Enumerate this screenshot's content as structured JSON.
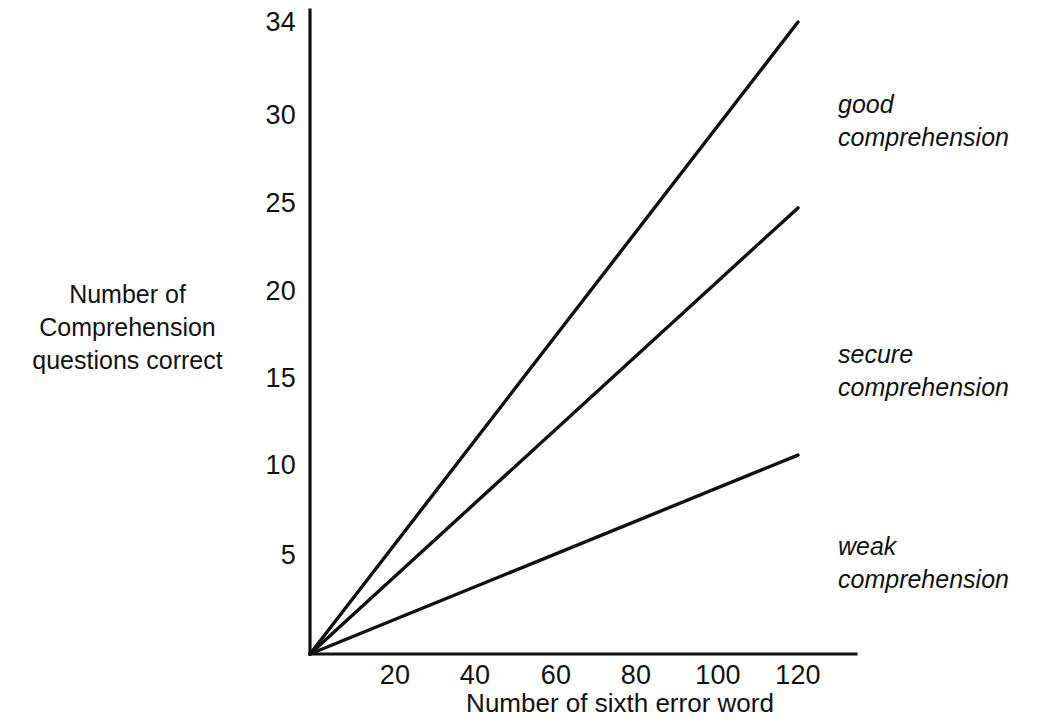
{
  "chart_data": {
    "type": "line",
    "title": "",
    "subtitle": "",
    "xlabel": "Number of sixth error word",
    "ylabel": "Number of Comprehension questions correct",
    "ylabel_lines": [
      "Number of",
      "Comprehension",
      "questions correct"
    ],
    "xlim": [
      0,
      136
    ],
    "ylim": [
      0,
      34
    ],
    "xticks": [
      20,
      40,
      60,
      80,
      100,
      120
    ],
    "xtick_labels": [
      "20",
      "40",
      "60",
      "80",
      "100",
      "120"
    ],
    "yticks": [
      5,
      10,
      15,
      20,
      25,
      30,
      34
    ],
    "ytick_labels": [
      "5",
      "10",
      "15",
      "20",
      "25",
      "30",
      "34"
    ],
    "grid": false,
    "legend_position": "right-inline-annotations",
    "line_color": "#111111",
    "axis_color": "#111111",
    "background_color": "#ffffff",
    "series": [
      {
        "name": "good comprehension",
        "x": [
          0,
          120
        ],
        "values": [
          0,
          34
        ],
        "slope": 0.2833,
        "annotation_lines": [
          "good",
          "comprehension"
        ]
      },
      {
        "name": "secure comprehension",
        "x": [
          0,
          120
        ],
        "values": [
          0,
          24
        ],
        "slope": 0.2,
        "annotation_lines": [
          "secure",
          "comprehension"
        ]
      },
      {
        "name": "weak comprehension",
        "x": [
          0,
          120
        ],
        "values": [
          0,
          10.7
        ],
        "slope": 0.0892,
        "annotation_lines": [
          "weak",
          "comprehension"
        ]
      }
    ]
  },
  "annotations": {
    "good": {
      "line1": "good",
      "line2": "comprehension"
    },
    "secure": {
      "line1": "secure",
      "line2": "comprehension"
    },
    "weak": {
      "line1": "weak",
      "line2": "comprehension"
    }
  },
  "axis_labels": {
    "y_line1": "Number of",
    "y_line2": "Comprehension",
    "y_line3": "questions correct",
    "x": "Number of sixth error word"
  },
  "ytick_values": {
    "t34": "34",
    "t30": "30",
    "t25": "25",
    "t20": "20",
    "t15": "15",
    "t10": "10",
    "t5": "5"
  },
  "xtick_values": {
    "t20": "20",
    "t40": "40",
    "t60": "60",
    "t80": "80",
    "t100": "100",
    "t120": "120"
  }
}
